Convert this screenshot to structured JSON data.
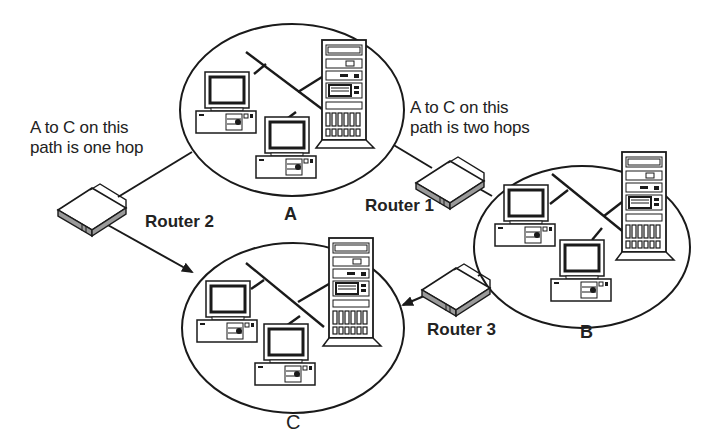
{
  "diagram": {
    "networks": [
      {
        "id": "A",
        "label": "A",
        "hosts": [
          "workstation",
          "workstation",
          "server"
        ]
      },
      {
        "id": "B",
        "label": "B",
        "hosts": [
          "workstation",
          "workstation",
          "server"
        ]
      },
      {
        "id": "C",
        "label": "C",
        "hosts": [
          "workstation",
          "workstation",
          "server"
        ]
      }
    ],
    "routers": [
      {
        "id": "router1",
        "label": "Router 1",
        "connects": [
          "A",
          "B"
        ]
      },
      {
        "id": "router2",
        "label": "Router 2",
        "connects": [
          "A",
          "C"
        ]
      },
      {
        "id": "router3",
        "label": "Router 3",
        "connects": [
          "B",
          "C"
        ]
      }
    ],
    "annotations": {
      "one_hop_line1": "A to C on this",
      "one_hop_line2": "path is one hop",
      "two_hops_line1": "A to C on this",
      "two_hops_line2": "path is two hops"
    },
    "colors": {
      "stroke": "#1a1a1a",
      "router_side": "#9a9a9a",
      "background": "#ffffff"
    }
  }
}
